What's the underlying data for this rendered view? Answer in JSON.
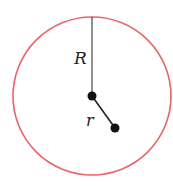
{
  "diagram": {
    "type": "circle-with-radii",
    "circle": {
      "cx": 92,
      "cy": 96,
      "r": 79,
      "stroke": "#e8646a"
    },
    "center_point": {
      "x": 92,
      "y": 96,
      "r": 4.5
    },
    "outer_point": {
      "x": 115,
      "y": 128,
      "r": 4.5
    },
    "labels": {
      "R": "R",
      "r": "r"
    }
  }
}
